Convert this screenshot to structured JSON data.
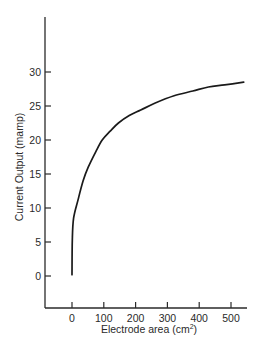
{
  "chart_data": {
    "type": "line",
    "title": "",
    "xlabel": "Electrode area (cm²)",
    "ylabel": "Current Output (mamp)",
    "xlim": [
      -85,
      555
    ],
    "ylim": [
      -5,
      38
    ],
    "xticks": [
      0,
      100,
      200,
      300,
      400,
      500
    ],
    "yticks": [
      0,
      5,
      10,
      15,
      20,
      25,
      30
    ],
    "grid": false,
    "legend": null,
    "series": [
      {
        "name": "Current Output",
        "color": "#1a1a1a",
        "x": [
          0,
          1,
          5,
          19,
          35,
          51,
          75,
          95,
          120,
          146,
          180,
          216,
          260,
          321,
          380,
          429,
          480,
          540
        ],
        "y": [
          0.2,
          5.3,
          8.5,
          11.2,
          14.0,
          16.0,
          18.3,
          20.0,
          21.3,
          22.5,
          23.6,
          24.4,
          25.4,
          26.5,
          27.2,
          27.8,
          28.1,
          28.5
        ]
      }
    ]
  },
  "labels": {
    "xlabel_main": "Electrode area (cm",
    "xlabel_sup": "2",
    "xlabel_close": ")",
    "ylabel": "Current Output (mamp)"
  }
}
